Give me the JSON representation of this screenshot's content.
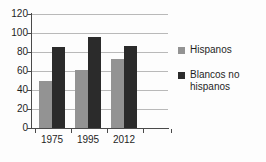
{
  "chart_data": {
    "type": "bar",
    "title": "",
    "subtitle": "",
    "xlabel": "",
    "ylabel": "",
    "categories": [
      "1975",
      "1995",
      "2012"
    ],
    "series": [
      {
        "name": "Hispanos",
        "color": "#939393",
        "values": [
          50,
          61,
          73
        ]
      },
      {
        "name": "Blancos no hispanos",
        "color": "#2b2b2b",
        "values": [
          85,
          96,
          86
        ]
      }
    ],
    "ylim": [
      0,
      120
    ],
    "ytick_labels": [
      "0",
      "20",
      "40",
      "60",
      "80",
      "100",
      "120"
    ],
    "ytick_values": [
      0,
      20,
      40,
      60,
      80,
      100,
      120
    ],
    "grid": true,
    "grid_axis": "y",
    "legend_position": "right"
  },
  "legend": {
    "items": [
      {
        "label": "Hispanos"
      },
      {
        "label": "Blancos no hispanos"
      }
    ]
  },
  "colors": {
    "series_hispanos": "#939393",
    "series_blancos": "#2b2b2b",
    "gridline": "#b9b9b9",
    "axis": "#4a4a4a",
    "background": "#fdfdfd"
  }
}
